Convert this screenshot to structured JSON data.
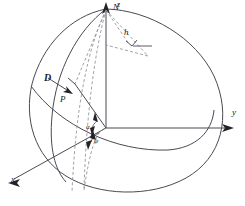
{
  "figure": {
    "stroke_color": "#4a4a52",
    "dash_color": "#8a8a92",
    "text_color": "#1a1a1a",
    "background": "#ffffff"
  },
  "axes": {
    "z": {
      "label": "z",
      "x": 117,
      "y": 2,
      "size": 8
    },
    "y": {
      "label": "y",
      "x": 232,
      "y": 108,
      "size": 9
    },
    "x": {
      "label": "x",
      "x": 11,
      "y": 175,
      "size": 9
    }
  },
  "points": {
    "north_pole": {
      "label": "N",
      "x": 113,
      "y": 3,
      "size": 9
    },
    "p": {
      "label": "P",
      "x": 60,
      "y": 95,
      "size": 9
    }
  },
  "vectors": {
    "d": {
      "label": "D",
      "x": 44,
      "y": 73,
      "size": 10
    }
  },
  "measures": {
    "h": {
      "label": "h",
      "x": 124,
      "y": 28,
      "size": 9
    },
    "alpha": {
      "label": "α",
      "x": 86,
      "y": 124,
      "size": 7
    },
    "psi": {
      "label": "ψ",
      "x": 94,
      "y": 138,
      "size": 7
    }
  },
  "geometry": {
    "sphere_outline": "M 106 9 C 150 10 196 38 214 76 C 232 116 222 158 186 178 C 150 198 98 196 66 176 C 34 156 24 118 32 84 C 42 46 70 16 106 9 Z",
    "meridian_left": "M 106 9 C 78 30 56 70 52 116 C 49 148 55 170 66 182",
    "equator_front": "M 31 86 C 60 126 116 152 168 150 C 196 148 212 132 214 110",
    "z_axis_line": "M 106 10 L 106 128",
    "y_axis_line": "M 106 128 L 226 128",
    "x_axis_line": "M 106 128 L 14 179",
    "z_arrow": "M 106 2 L 102 14 L 106 11 L 110 14 Z",
    "y_arrow": "M 234 128 L 222 124 L 225 128 L 222 132 Z",
    "x_arrow": "M 8 183 L 20 179 L 17 183 L 20 187 Z",
    "radius_to_p": "M 106 128 L 75 84",
    "p_marker": "M 75 84 L 68 78",
    "d_arrow_shaft": "M 48 78 L 70 92",
    "d_arrow_head": "M 73 94 L 63 92 L 67 90 L 66 86 Z",
    "dash_n_to_p": "M 106 10 L 75 84",
    "dash_n_to_foot": "M 106 10 L 148 56",
    "dash_foot_to_center": "M 148 56 L 106 45",
    "dash_h": "M 106 10 L 129 44",
    "right_angle": "M 126 41 L 132 46 L 137 40",
    "right_angle_bar": "M 133 46 L 152 46",
    "dash_meridian_a": "M 106 10 C 88 48 76 104 72 192",
    "dash_meridian_b": "M 106 10 C 94 54 86 120 84 190",
    "dash_small_arc": "M 84 190 C 90 150 96 130 106 128",
    "angle_arc_alpha": "M 97 121 A 12 12 0 0 0 92 131",
    "angle_arc_psi": "M 99 133 A 14 14 0 0 0 91 142",
    "alpha_tick_a": "M 95 112 L 98 122 L 93 120 Z",
    "alpha_tick_b": "M 92 136 L 95 126 L 90 128 Z",
    "psi_tick_a": "M 93 130 L 96 140 L 90 138 Z",
    "psi_tick_b": "M 88 150 L 92 140 L 86 142 Z"
  }
}
